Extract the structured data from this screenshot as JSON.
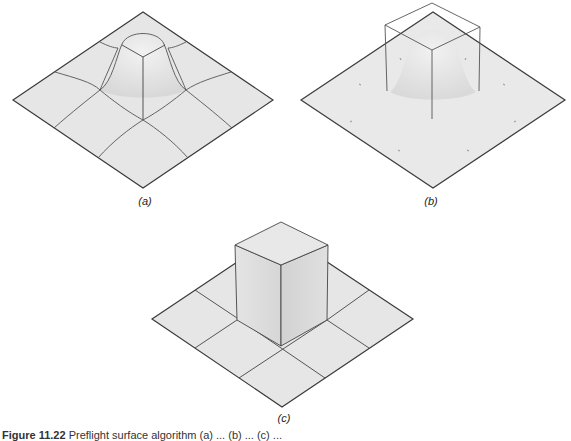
{
  "panels": [
    {
      "id": "a",
      "label": "(a)",
      "description": "Smooth bump surface with curved grid lines"
    },
    {
      "id": "b",
      "label": "(b)",
      "description": "Smooth bump surface with wireframe box outline"
    },
    {
      "id": "c",
      "label": "(c)",
      "description": "Box extruded from flat plane with 3x3 grid"
    }
  ],
  "caption": {
    "figure_number": "Figure 11.22",
    "text": "Preflight surface algorithm (a) ... (b) ... (c) ..."
  },
  "colors": {
    "surface": "#e6e6e6",
    "edge": "#3a3a3a",
    "grid": "#555555",
    "background": "#ffffff"
  }
}
